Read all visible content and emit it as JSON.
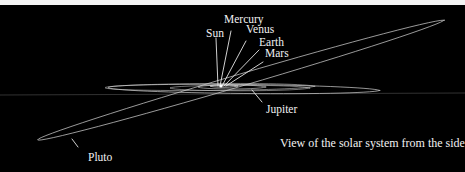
{
  "diagram": {
    "caption": "View of the solar system from the side",
    "labels": {
      "sun": "Sun",
      "mercury": "Mercury",
      "venus": "Venus",
      "earth": "Earth",
      "mars": "Mars",
      "jupiter": "Jupiter",
      "pluto": "Pluto"
    },
    "colors": {
      "background": "#000000",
      "orbit": "#cfcfcf",
      "text": "#f2f2f2"
    }
  }
}
